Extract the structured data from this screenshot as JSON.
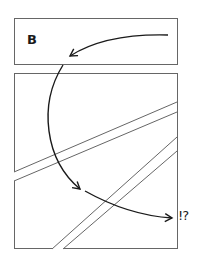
{
  "diagram": {
    "panel_top": {
      "label": "B"
    },
    "annotation": {
      "text": "!?"
    },
    "colors": {
      "stroke": "#555555",
      "arrow": "#1a1a1a",
      "background": "#ffffff"
    }
  }
}
